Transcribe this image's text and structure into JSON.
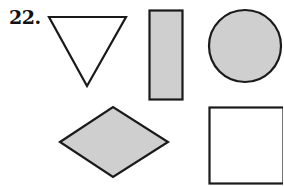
{
  "problem": {
    "number_label": "22."
  },
  "shapes": [
    {
      "name": "triangle",
      "orientation": "pointing-down",
      "fill": "#ffffff",
      "stroke": "#1a1a1a",
      "shaded": false
    },
    {
      "name": "rectangle",
      "orientation": "vertical",
      "fill": "#cfcfcf",
      "stroke": "#1a1a1a",
      "shaded": true
    },
    {
      "name": "circle",
      "fill": "#cfcfcf",
      "stroke": "#1a1a1a",
      "shaded": true
    },
    {
      "name": "rhombus",
      "fill": "#cfcfcf",
      "stroke": "#1a1a1a",
      "shaded": true
    },
    {
      "name": "square",
      "fill": "#ffffff",
      "stroke": "#1a1a1a",
      "shaded": false
    }
  ],
  "colors": {
    "shade": "#cfcfcf",
    "stroke": "#1a1a1a",
    "background": "#ffffff"
  }
}
